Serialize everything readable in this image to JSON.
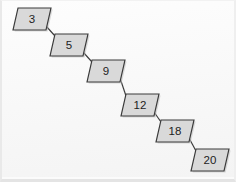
{
  "figure": {
    "kind": "skip-list-chain-diagram",
    "background_color": "#fbfbfb",
    "node_fill_color": "#d9d9d9",
    "node_border_color": "#3a3a3a",
    "connector_color": "#3a3a3a",
    "label_color": "#1d1d1d",
    "node_count": 6,
    "orientation": "descending-left-to-right-staircase"
  },
  "nodes": [
    {
      "label": "3",
      "x": 13,
      "y": 8,
      "w": 33,
      "h": 22,
      "skew": 5
    },
    {
      "label": "5",
      "x": 50,
      "y": 34,
      "w": 33,
      "h": 22,
      "skew": 5
    },
    {
      "label": "9",
      "x": 87,
      "y": 60,
      "w": 33,
      "h": 22,
      "skew": 5
    },
    {
      "label": "12",
      "x": 121,
      "y": 94,
      "w": 33,
      "h": 22,
      "skew": 5
    },
    {
      "label": "18",
      "x": 156,
      "y": 120,
      "w": 33,
      "h": 22,
      "skew": 5
    },
    {
      "label": "20",
      "x": 191,
      "y": 149,
      "w": 33,
      "h": 22,
      "skew": 5
    }
  ],
  "connectors": [
    {
      "from": "3",
      "to": "5",
      "x1": 46,
      "y1": 26,
      "x2": 55,
      "y2": 36
    },
    {
      "from": "5",
      "to": "9",
      "x1": 83,
      "y1": 52,
      "x2": 92,
      "y2": 62
    },
    {
      "from": "9",
      "to": "12",
      "x1": 120,
      "y1": 78,
      "x2": 126,
      "y2": 96
    },
    {
      "from": "12",
      "to": "18",
      "x1": 154,
      "y1": 112,
      "x2": 161,
      "y2": 122
    },
    {
      "from": "18",
      "to": "20",
      "x1": 189,
      "y1": 138,
      "x2": 196,
      "y2": 151
    }
  ]
}
